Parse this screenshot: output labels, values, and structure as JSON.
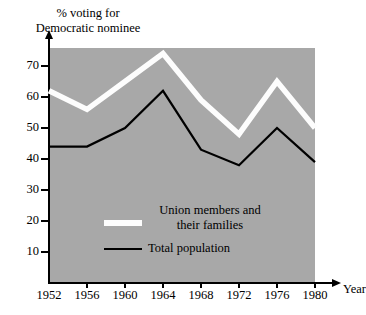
{
  "chart_data": {
    "type": "line",
    "title": "% voting for\nDemocratic nominee",
    "xlabel": "Year",
    "ylabel": "% voting for Democratic nominee",
    "categories": [
      "1952",
      "1956",
      "1960",
      "1964",
      "1968",
      "1972",
      "1976",
      "1980"
    ],
    "x": [
      1952,
      1956,
      1960,
      1964,
      1968,
      1972,
      1976,
      1980
    ],
    "xlim": [
      1950,
      1982
    ],
    "ylim": [
      0,
      78
    ],
    "yticks": [
      "10",
      "20",
      "30",
      "40",
      "50",
      "60",
      "70"
    ],
    "ytick_values": [
      10,
      20,
      30,
      40,
      50,
      60,
      70
    ],
    "grid": false,
    "legend_position": "inside-lower-left",
    "plot_background": "#a8a8a8",
    "series": [
      {
        "name": "Union members and\ntheir families",
        "color": "#fdfdfd",
        "width": 5.5,
        "values": [
          62,
          56,
          65,
          74,
          59,
          48,
          65,
          50
        ]
      },
      {
        "name": "Total population",
        "color": "#000000",
        "width": 2.2,
        "values": [
          44,
          44,
          50,
          62,
          43,
          38,
          50,
          39
        ]
      }
    ]
  },
  "axes": {
    "y_arrow_icon": "arrow-up-icon",
    "x_arrow_icon": "arrow-right-icon"
  }
}
